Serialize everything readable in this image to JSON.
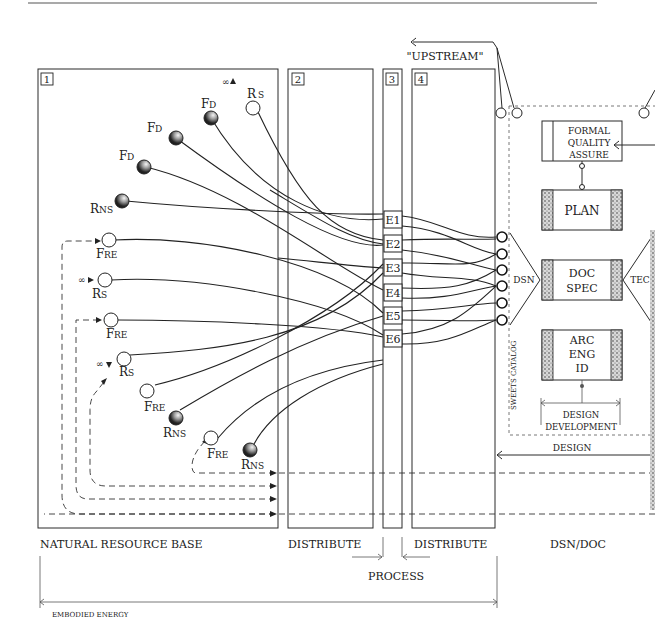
{
  "upstream_label": "\"UPSTREAM\"",
  "zones": [
    {
      "number": "1",
      "label": "NATURAL RESOURCE BASE"
    },
    {
      "number": "2",
      "label": "DISTRIBUTE"
    },
    {
      "number": "3",
      "label": "PROCESS"
    },
    {
      "number": "4",
      "label": "DISTRIBUTE"
    },
    {
      "number": "",
      "label": "DSN/DOC"
    }
  ],
  "bottom_span_label": "EMBODIED ENERGY",
  "infinity_symbol": "∞",
  "resource_nodes": [
    {
      "id": "rs-top",
      "label_main": "R",
      "label_sub": "S",
      "type": "open",
      "infinite_source": true
    },
    {
      "id": "fd-1",
      "label_main": "F",
      "label_sub": "D",
      "type": "dark"
    },
    {
      "id": "fd-2",
      "label_main": "F",
      "label_sub": "D",
      "type": "dark"
    },
    {
      "id": "fd-3",
      "label_main": "F",
      "label_sub": "D",
      "type": "dark"
    },
    {
      "id": "rns-1",
      "label_main": "R",
      "label_sub": "NS",
      "type": "dark"
    },
    {
      "id": "fre-1",
      "label_main": "F",
      "label_sub": "RE",
      "type": "open"
    },
    {
      "id": "rs-2",
      "label_main": "R",
      "label_sub": "S",
      "type": "open",
      "infinite_source": true
    },
    {
      "id": "fre-2",
      "label_main": "F",
      "label_sub": "RE",
      "type": "open"
    },
    {
      "id": "rs-3",
      "label_main": "R",
      "label_sub": "S",
      "type": "open",
      "infinite_source": true
    },
    {
      "id": "fre-3",
      "label_main": "F",
      "label_sub": "RE",
      "type": "open"
    },
    {
      "id": "rns-2",
      "label_main": "R",
      "label_sub": "NS",
      "type": "dark"
    },
    {
      "id": "fre-4",
      "label_main": "F",
      "label_sub": "RE",
      "type": "open"
    },
    {
      "id": "rns-3",
      "label_main": "R",
      "label_sub": "NS",
      "type": "dark"
    }
  ],
  "process_units": [
    "E1",
    "E2",
    "E3",
    "E4",
    "E5",
    "E6"
  ],
  "catalog_label": "SWEETS CATALOG",
  "dsn_label": "DSN",
  "tec_label": "TEC",
  "design_boxes": [
    {
      "id": "formal-quality-assure",
      "lines": [
        "FORMAL",
        "QUALITY",
        "ASSURE"
      ]
    },
    {
      "id": "plan",
      "lines": [
        "PLAN"
      ]
    },
    {
      "id": "doc-spec",
      "lines": [
        "DOC",
        "SPEC"
      ]
    },
    {
      "id": "arc-eng-id",
      "lines": [
        "ARC",
        "ENG",
        "ID"
      ]
    }
  ],
  "design_development_label": [
    "DESIGN",
    "DEVELOPMENT"
  ],
  "design_arrow_label": "DESIGN"
}
